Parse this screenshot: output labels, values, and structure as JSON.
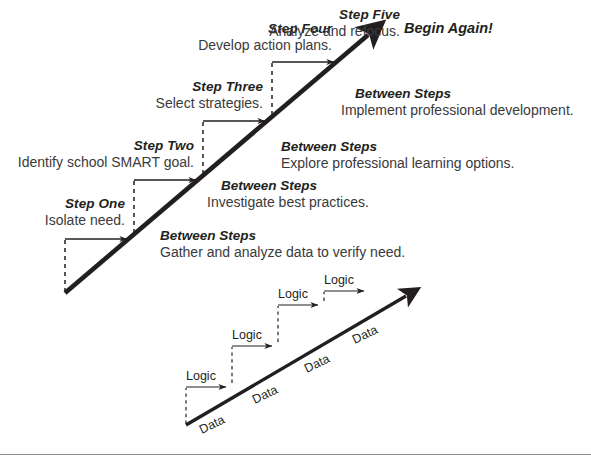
{
  "diagram": {
    "colors": {
      "line": "#231f20",
      "text": "#231f20",
      "subtext": "#3a3a3c",
      "rule": "#8d8d8d",
      "background": "#ffffff"
    },
    "main": {
      "end_label": "Begin Again!",
      "steps": [
        {
          "title": "Step One",
          "desc": "Isolate need."
        },
        {
          "title": "Step Two",
          "desc": "Identify school SMART goal."
        },
        {
          "title": "Step Three",
          "desc": "Select strategies."
        },
        {
          "title": "Step Four",
          "desc": "Develop action plans."
        },
        {
          "title": "Step Five",
          "desc": "Analyze and refocus."
        }
      ],
      "between": [
        {
          "title": "Between Steps",
          "desc": "Gather and analyze data to verify need."
        },
        {
          "title": "Between Steps",
          "desc": "Investigate best practices."
        },
        {
          "title": "Between Steps",
          "desc": "Explore professional learning options."
        },
        {
          "title": "Between Steps",
          "desc": "Implement professional development."
        }
      ]
    },
    "mini": {
      "logic_labels": [
        "Logic",
        "Logic",
        "Logic",
        "Logic"
      ],
      "data_labels": [
        "Data",
        "Data",
        "Data",
        "Data"
      ]
    }
  }
}
